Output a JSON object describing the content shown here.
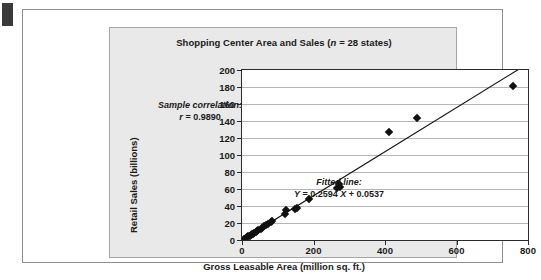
{
  "figure": {
    "edge_tab_color": "#3a3a3a",
    "panel_color": "#e9e9e9",
    "plot_bg": "#ffffff"
  },
  "chart_data": {
    "type": "scatter",
    "title": "Shopping Center Area and Sales (n = 28 states)",
    "title_pre": "Shopping Center Area and Sales (",
    "title_italic": "n",
    "title_post": " = 28 states)",
    "xlabel": "Gross Leasable Area (million sq. ft.)",
    "ylabel": "Retail Sales (billions)",
    "xlim": [
      0,
      800
    ],
    "ylim": [
      0,
      200
    ],
    "xticks": [
      0,
      200,
      400,
      600,
      800
    ],
    "yticks": [
      0,
      20,
      40,
      60,
      80,
      100,
      120,
      140,
      160,
      180,
      200
    ],
    "grid": "horizontal",
    "legend": "none",
    "marker": "diamond",
    "marker_color": "#111111",
    "n": 28,
    "correlation_label": "Sample correlation:",
    "correlation_value_prefix": "r",
    "correlation_value": " = 0.9890",
    "fitted_label": "Fitted line:",
    "fitted_equation_y": "Y",
    "fitted_equation_mid": " = 0.2594 ",
    "fitted_equation_x": "X",
    "fitted_equation_end": " + 0.0537",
    "fit_slope": 0.2594,
    "fit_intercept": 0.0537,
    "points": [
      {
        "x": 6,
        "y": 1.5
      },
      {
        "x": 10,
        "y": 2.6
      },
      {
        "x": 14,
        "y": 3.4
      },
      {
        "x": 18,
        "y": 4.3
      },
      {
        "x": 21,
        "y": 5.2
      },
      {
        "x": 25,
        "y": 6.1
      },
      {
        "x": 28,
        "y": 6.8
      },
      {
        "x": 31,
        "y": 7.6
      },
      {
        "x": 34,
        "y": 8.4
      },
      {
        "x": 38,
        "y": 9.3
      },
      {
        "x": 42,
        "y": 10.4
      },
      {
        "x": 46,
        "y": 11.6
      },
      {
        "x": 52,
        "y": 13.2
      },
      {
        "x": 57,
        "y": 14.6
      },
      {
        "x": 62,
        "y": 16.0
      },
      {
        "x": 67,
        "y": 17.3
      },
      {
        "x": 73,
        "y": 19.0
      },
      {
        "x": 80,
        "y": 20.9
      },
      {
        "x": 85,
        "y": 21.8
      },
      {
        "x": 120,
        "y": 31.0
      },
      {
        "x": 124,
        "y": 35.5
      },
      {
        "x": 148,
        "y": 36.5
      },
      {
        "x": 155,
        "y": 37.5
      },
      {
        "x": 188,
        "y": 48.5
      },
      {
        "x": 266,
        "y": 61.0
      },
      {
        "x": 274,
        "y": 62.5
      },
      {
        "x": 272,
        "y": 65.5
      },
      {
        "x": 410,
        "y": 126.5
      },
      {
        "x": 490,
        "y": 144.0
      },
      {
        "x": 758,
        "y": 181.0
      }
    ]
  }
}
